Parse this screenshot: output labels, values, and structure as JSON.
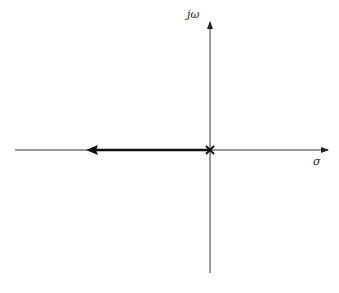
{
  "diagram": {
    "type": "root-locus",
    "axes": {
      "imaginary_label": "jω",
      "real_label": "σ"
    },
    "poles": [
      {
        "re": 0,
        "im": 0,
        "marker": "×"
      }
    ],
    "locus_branches": [
      {
        "from": "origin",
        "direction": "negative real axis",
        "arrow": "left"
      }
    ],
    "colors": {
      "axis": "#333333",
      "locus": "#111111",
      "background": "#ffffff"
    }
  }
}
